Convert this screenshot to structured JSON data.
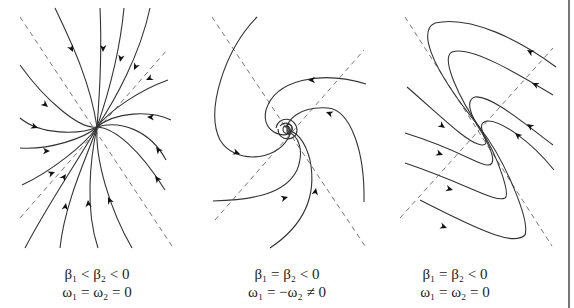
{
  "figure": {
    "panels": [
      {
        "id": "stable-node",
        "portrait": "improper node: trajectories converge tangentially along slow eigendirection",
        "caption_line1": "β₁ < β₂ < 0",
        "caption_line2": "ω₁ = ω₂ = 0"
      },
      {
        "id": "stable-focus",
        "portrait": "stable spiral: trajectories spiral inward to origin",
        "caption_line1": "β₁ = β₂ < 0",
        "caption_line2": "ω₁ = −ω₂ ≠ 0"
      },
      {
        "id": "degenerate-node",
        "portrait": "degenerate node: trajectories turn and approach along single eigendirection",
        "caption_line1": "β₁ = β₂ < 0",
        "caption_line2": "ω₁ = ω₂ = 0"
      }
    ],
    "colors": {
      "trajectory": "#333333",
      "axis_dashed": "#777777",
      "arrowhead": "#111111"
    }
  }
}
